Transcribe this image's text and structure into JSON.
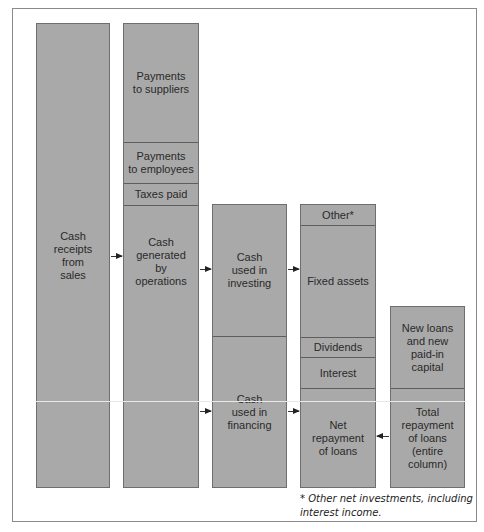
{
  "diagram": {
    "title": "",
    "columns": [
      {
        "id": "sales",
        "segments": [
          {
            "label": "Cash\nreceipts\nfrom\nsales"
          }
        ]
      },
      {
        "id": "operations",
        "segments": [
          {
            "label": "Payments\nto suppliers"
          },
          {
            "label": "Payments\nto employees"
          },
          {
            "label": "Taxes paid"
          },
          {
            "label": "Cash\ngenerated\nby\noperations"
          }
        ]
      },
      {
        "id": "cash-uses",
        "segments": [
          {
            "label": "Cash\nused in\ninvesting"
          },
          {
            "label": "Cash\nused in\nfinancing"
          }
        ]
      },
      {
        "id": "breakdown",
        "segments": [
          {
            "label": "Other*"
          },
          {
            "label": "Fixed assets"
          },
          {
            "label": "Dividends"
          },
          {
            "label": "Interest"
          },
          {
            "label": "Net\nrepayment\nof loans"
          }
        ]
      },
      {
        "id": "loans",
        "segments": [
          {
            "label": "New loans\nand new\npaid-in\ncapital"
          },
          {
            "label": "Total\nrepayment\nof loans\n(entire\ncolumn)"
          }
        ]
      }
    ],
    "arrows": [
      {
        "from": "Cash receipts from sales",
        "to": "Cash generated by operations"
      },
      {
        "from": "Cash generated by operations",
        "to": "Cash used in investing"
      },
      {
        "from": "Cash generated by operations",
        "to": "Cash used in financing"
      },
      {
        "from": "Cash used in investing",
        "to": "Fixed assets"
      },
      {
        "from": "Cash used in financing",
        "to": "Net repayment of loans"
      },
      {
        "from": "Total repayment of loans",
        "to": "Net repayment of loans"
      }
    ],
    "footnote": "* Other net investments, including\ninterest income."
  }
}
